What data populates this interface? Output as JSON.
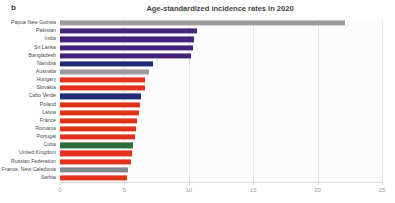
{
  "panel": {
    "label": "b"
  },
  "chart_data": {
    "type": "bar",
    "orientation": "horizontal",
    "title": "Age-standardized incidence rates in 2020",
    "xlabel": "",
    "ylabel": "",
    "xlim": [
      0,
      25
    ],
    "xticks": [
      0,
      5,
      10,
      15,
      20,
      25
    ],
    "xtick_labels": [
      "0",
      "5",
      "10",
      "15",
      "20",
      "25"
    ],
    "grid": true,
    "grid_axis": "x",
    "legend": "none",
    "categories": [
      "Papua New Guinea",
      "Pakistan",
      "India",
      "Sri Lanka",
      "Bangladesh",
      "Namibia",
      "Australia",
      "Hungary",
      "Slovakia",
      "Cabo Verde",
      "Poland",
      "Latvia",
      "France",
      "Romania",
      "Portugal",
      "Cuba",
      "United Kingdom",
      "Russian Federation",
      "France, New Caledonia",
      "Serbia"
    ],
    "values": [
      22.1,
      10.6,
      10.4,
      10.3,
      10.2,
      7.2,
      6.9,
      6.6,
      6.6,
      6.3,
      6.2,
      6.1,
      6.0,
      5.9,
      5.8,
      5.7,
      5.6,
      5.5,
      5.3,
      5.2
    ],
    "colors": [
      "#9c9c9c",
      "#45237a",
      "#45237a",
      "#45237a",
      "#45237a",
      "#1f2a78",
      "#9c9c9c",
      "#e23118",
      "#e23118",
      "#1f2a78",
      "#e23118",
      "#e23118",
      "#e23118",
      "#e23118",
      "#e23118",
      "#2d6b3d",
      "#e23118",
      "#e23118",
      "#808a8f",
      "#e23118"
    ]
  }
}
